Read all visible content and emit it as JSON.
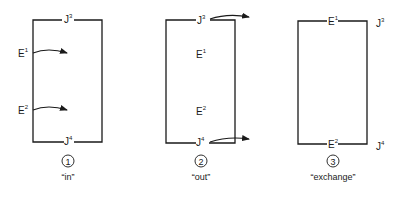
{
  "panels": [
    {
      "number": "1",
      "caption": "“in”",
      "labels": {
        "top": {
          "base": "J",
          "sup": "3"
        },
        "bottom": {
          "base": "J",
          "sup": "4"
        },
        "left_upper": {
          "base": "E",
          "sup": "1"
        },
        "left_lower": {
          "base": "E",
          "sup": "2"
        }
      }
    },
    {
      "number": "2",
      "caption": "“out”",
      "labels": {
        "top": {
          "base": "J",
          "sup": "3"
        },
        "bottom": {
          "base": "J",
          "sup": "4"
        },
        "inner_upper": {
          "base": "E",
          "sup": "1"
        },
        "inner_lower": {
          "base": "E",
          "sup": "2"
        }
      }
    },
    {
      "number": "3",
      "caption": "“exchange”",
      "labels": {
        "top": {
          "base": "E",
          "sup": "1"
        },
        "bottom": {
          "base": "E",
          "sup": "2"
        },
        "right_upper": {
          "base": "J",
          "sup": "3"
        },
        "right_lower": {
          "base": "J",
          "sup": "4"
        }
      }
    }
  ],
  "colors": {
    "line": "#1a1a1a",
    "background": "#ffffff"
  }
}
